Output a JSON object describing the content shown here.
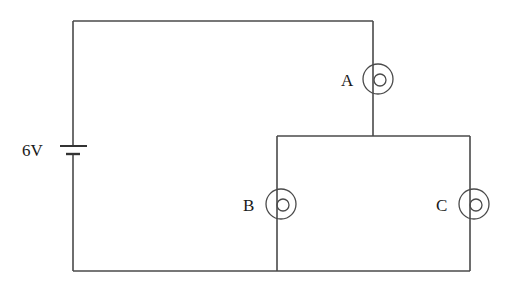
{
  "diagram": {
    "type": "circuit",
    "battery": {
      "label": "6V"
    },
    "bulbs": [
      {
        "id": "A",
        "label": "A",
        "position": "series, right branch top"
      },
      {
        "id": "B",
        "label": "B",
        "position": "parallel, left branch"
      },
      {
        "id": "C",
        "label": "C",
        "position": "parallel, right branch"
      }
    ],
    "colors": {
      "wire": "#4a4a4a",
      "text": "#1a1a1a",
      "background": "#ffffff"
    }
  }
}
